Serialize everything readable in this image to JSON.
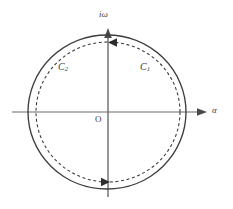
{
  "figure": {
    "background_color": "#ffffff",
    "line_color": "#3d3d3d",
    "axis_color": "#6b6b6b"
  },
  "axes": {
    "vertical": {
      "label": "iω",
      "name": "imaginary-axis",
      "x": 108,
      "y_top": 28,
      "y_bottom": 197,
      "arrow": "up"
    },
    "horizontal": {
      "label": "α",
      "name": "real-axis",
      "y": 112,
      "x_left": 12,
      "x_right": 207,
      "arrow": "right"
    },
    "origin": {
      "label": "O",
      "x": 108,
      "y": 112
    }
  },
  "contours": [
    {
      "name": "C1",
      "label": "C₁",
      "label_text": "C",
      "label_sub": "1",
      "style": "solid",
      "cx": 107,
      "cy": 112,
      "rx": 79,
      "ry": 77,
      "stroke_width": 1.3
    },
    {
      "name": "C2",
      "label": "C₂",
      "label_text": "C",
      "label_sub": "2",
      "style": "dashed",
      "cx": 108,
      "cy": 112,
      "rx": 72,
      "ry": 70,
      "stroke_width": 1.1,
      "dash_pattern": "3,2.6"
    }
  ],
  "direction_arrows": [
    {
      "name": "top-arrow",
      "x": 113,
      "y": 42,
      "direction": "left",
      "on_contour": "C2"
    },
    {
      "name": "bottom-arrow",
      "x": 104,
      "y": 182,
      "direction": "right",
      "on_contour": "C2"
    }
  ],
  "labels": {
    "imaginary_axis": "iω",
    "real_axis": "α",
    "origin": "O",
    "c1_base": "C",
    "c1_sub": "1",
    "c2_base": "C",
    "c2_sub": "2"
  }
}
